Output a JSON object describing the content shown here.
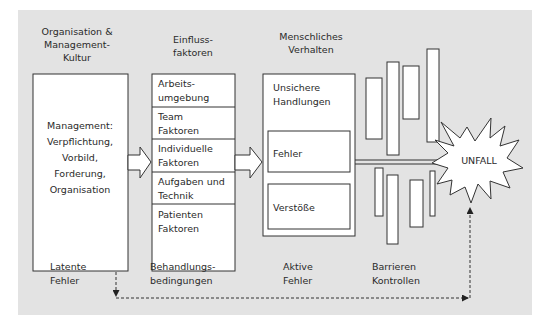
{
  "diagram": {
    "columns": [
      {
        "id": "organisation",
        "heading": [
          "Organisation &",
          "Management-",
          "Kultur"
        ],
        "footer": [
          "Latente",
          "Fehler"
        ]
      },
      {
        "id": "einfluss",
        "heading": [
          "Einfluss-",
          "faktoren"
        ],
        "footer": [
          "Behandlungs-",
          "bedingungen"
        ]
      },
      {
        "id": "verhalten",
        "heading": [
          "Menschliches",
          "Verhalten"
        ],
        "footer": [
          "Aktive",
          "Fehler"
        ]
      },
      {
        "id": "barrieren",
        "heading": [],
        "footer": [
          "Barrieren",
          "Kontrollen"
        ]
      }
    ],
    "management_box": [
      "Management:",
      "Verpflichtung,",
      "Vorbild,",
      "Forderung,",
      "Organisation"
    ],
    "factors": [
      [
        "Arbeits-",
        "umgebung"
      ],
      [
        "Team",
        "Faktoren"
      ],
      [
        "Individuelle",
        "Faktoren"
      ],
      [
        "Aufgaben und",
        "Technik"
      ],
      [
        "Patienten",
        "Faktoren"
      ]
    ],
    "unsafe_acts": {
      "title": [
        "Unsichere",
        "Handlungen"
      ],
      "items": [
        "Fehler",
        "Verstöße"
      ]
    },
    "outcome": "UNFALL",
    "colors": {
      "panel": "#e3e3e3",
      "box_fill": "#ffffff",
      "stroke": "#333333"
    }
  }
}
